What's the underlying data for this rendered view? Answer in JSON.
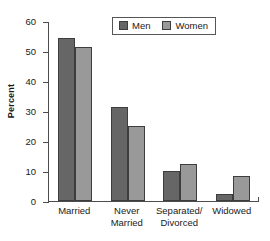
{
  "chart_data": {
    "type": "bar",
    "title": "",
    "xlabel": "",
    "ylabel": "Percent",
    "ylim": [
      0,
      60
    ],
    "yticks": [
      0,
      10,
      20,
      30,
      40,
      50,
      60
    ],
    "grid": false,
    "legend_position": "top-center",
    "categories": [
      "Married",
      "Never\nMarried",
      "Separated/\nDivorced",
      "Widowed"
    ],
    "series": [
      {
        "name": "Men",
        "color": "#666666",
        "values": [
          54.5,
          31.5,
          10.0,
          2.5
        ]
      },
      {
        "name": "Women",
        "color": "#999999",
        "values": [
          51.5,
          25.0,
          12.5,
          8.5
        ]
      }
    ]
  },
  "legend": {
    "entries": [
      {
        "label": "Men",
        "color": "#666666"
      },
      {
        "label": "Women",
        "color": "#999999"
      }
    ]
  },
  "axis": {
    "y_label": "Percent",
    "y_tick_labels": [
      "0",
      "10",
      "20",
      "30",
      "40",
      "50",
      "60"
    ],
    "x_tick_labels": [
      "Married",
      "Never\nMarried",
      "Separated/\nDivorced",
      "Widowed"
    ]
  },
  "colors": {
    "men_bar": "#666666",
    "women_bar": "#999999",
    "bar_outline": "#3d3d3d",
    "axis": "#4d4d4d",
    "legend_border": "#555555",
    "background": "#ffffff",
    "text": "#1a1a1a"
  }
}
